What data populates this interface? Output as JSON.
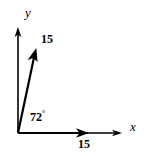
{
  "figure": {
    "type": "vector-diagram",
    "background_color": "#ffffff",
    "stroke_color": "#000000",
    "axes": {
      "origin": {
        "x": 18,
        "y": 133
      },
      "x_axis": {
        "label": "x",
        "end": {
          "x": 122,
          "y": 133
        },
        "arrow": true
      },
      "y_axis": {
        "label": "y",
        "end": {
          "x": 18,
          "y": 28
        },
        "arrow": true
      }
    },
    "vectors": [
      {
        "name": "slanted-vector",
        "magnitude_label": "15",
        "angle_label": "72",
        "angle_unit": "°",
        "angle_degrees": 72,
        "tip": {
          "x": 36,
          "y": 50
        },
        "arrow": true
      },
      {
        "name": "horizontal-vector",
        "magnitude_label": "15",
        "angle_degrees": 0,
        "tip": {
          "x": 88,
          "y": 133
        },
        "arrow": true
      }
    ]
  },
  "labels": {
    "y_axis": "y",
    "x_axis": "x",
    "vector_magnitude": "15",
    "xvector_magnitude": "15",
    "angle_value": "72",
    "angle_degree_symbol": "°"
  }
}
